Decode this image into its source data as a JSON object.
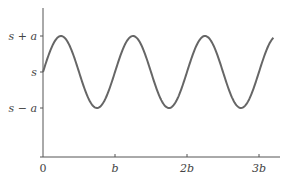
{
  "chart_data": {
    "type": "line",
    "title": "",
    "xlabel": "",
    "ylabel": "",
    "function": "y = s + a*sin(2*pi*x/b)",
    "x_range_units_b": [
      0,
      3.2
    ],
    "x_ticks": [
      {
        "value": 0,
        "label": "0"
      },
      {
        "value": 1,
        "label": "b"
      },
      {
        "value": 2,
        "label": "2b"
      },
      {
        "value": 3,
        "label": "3b"
      }
    ],
    "y_ticks": [
      {
        "value": 1,
        "label": "s + a"
      },
      {
        "value": 0,
        "label": "s"
      },
      {
        "value": -1,
        "label": "s − a"
      }
    ],
    "series": [
      {
        "name": "sinusoid",
        "x": [
          0,
          0.25,
          0.5,
          0.75,
          1,
          1.25,
          1.5,
          1.75,
          2,
          2.25,
          2.5,
          2.75,
          3,
          3.2
        ],
        "values": [
          0,
          1,
          0,
          -1,
          0,
          1,
          0,
          -1,
          0,
          1,
          0,
          -1,
          0,
          0.95
        ]
      }
    ],
    "grid": false,
    "legend": null,
    "color": "#666666"
  }
}
